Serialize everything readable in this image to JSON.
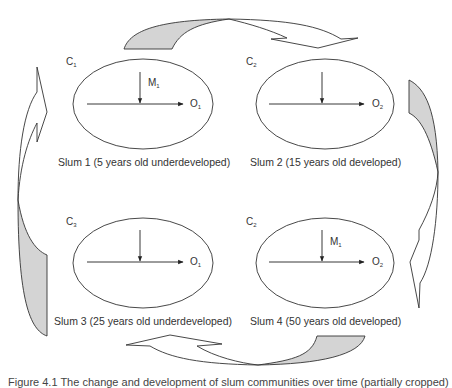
{
  "diagram": {
    "type": "cycle",
    "colors": {
      "stroke": "#333333",
      "shaded_fill": "#d4d4d4",
      "background": "#ffffff"
    },
    "nodes": [
      {
        "id": "slum1",
        "community_label": "C",
        "community_sub": "1",
        "input_label": "M",
        "input_sub": "1",
        "output_label": "O",
        "output_sub": "1",
        "caption": "Slum 1 (5 years old underdeveloped)"
      },
      {
        "id": "slum2",
        "community_label": "C",
        "community_sub": "2",
        "input_label": "",
        "input_sub": "",
        "output_label": "O",
        "output_sub": "2",
        "caption": "Slum 2 (15 years old developed)"
      },
      {
        "id": "slum3",
        "community_label": "C",
        "community_sub": "3",
        "input_label": "",
        "input_sub": "",
        "output_label": "O",
        "output_sub": "1",
        "caption": "Slum 3 (25 years old underdeveloped)"
      },
      {
        "id": "slum4",
        "community_label": "C",
        "community_sub": "2",
        "input_label": "M",
        "input_sub": "1",
        "output_label": "O",
        "output_sub": "2",
        "caption": "Slum 4 (50 years old developed)"
      }
    ],
    "arrows": [
      {
        "from": "slum1",
        "to": "slum2",
        "position": "top",
        "direction": "clockwise"
      },
      {
        "from": "slum2",
        "to": "slum4",
        "position": "right",
        "direction": "clockwise"
      },
      {
        "from": "slum4",
        "to": "slum3",
        "position": "bottom",
        "direction": "clockwise"
      },
      {
        "from": "slum3",
        "to": "slum1",
        "position": "left",
        "direction": "clockwise"
      }
    ],
    "figure_caption": "Figure 4.1  The change and development of slum communities over time (partially cropped)"
  }
}
